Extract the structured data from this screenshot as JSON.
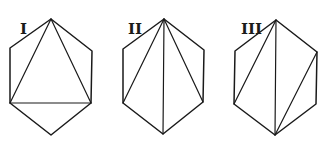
{
  "figure": {
    "line_color": "#1a1a1a",
    "background": "#ffffff",
    "panels": [
      {
        "label": "I",
        "label_pos": [
          20,
          34
        ],
        "vertices": {
          "top": [
            51,
            19
          ],
          "upper_right": [
            92,
            51
          ],
          "lower_right": [
            91,
            103
          ],
          "bottom": [
            51,
            135
          ],
          "lower_left": [
            10,
            103
          ],
          "upper_left": [
            10,
            48
          ]
        },
        "diagonals": [
          [
            "top",
            "lower_left"
          ],
          [
            "top",
            "lower_right"
          ],
          [
            "lower_left",
            "lower_right"
          ]
        ]
      },
      {
        "label": "II",
        "label_pos": [
          128,
          34
        ],
        "vertices": {
          "top": [
            164,
            19
          ],
          "upper_right": [
            204,
            50
          ],
          "lower_right": [
            203,
            102
          ],
          "bottom": [
            163,
            134
          ],
          "lower_left": [
            123,
            103
          ],
          "upper_left": [
            123,
            49
          ]
        },
        "diagonals": [
          [
            "top",
            "lower_left"
          ],
          [
            "top",
            "bottom"
          ],
          [
            "top",
            "lower_right"
          ]
        ]
      },
      {
        "label": "III",
        "label_pos": [
          241,
          34
        ],
        "vertices": {
          "top": [
            276,
            20
          ],
          "upper_right": [
            317,
            52
          ],
          "lower_right": [
            316,
            104
          ],
          "bottom": [
            275,
            135
          ],
          "lower_left": [
            234,
            104
          ],
          "upper_left": [
            235,
            51
          ]
        },
        "diagonals": [
          [
            "top",
            "lower_left"
          ],
          [
            "top",
            "bottom"
          ],
          [
            "upper_right",
            "bottom"
          ]
        ]
      }
    ]
  }
}
